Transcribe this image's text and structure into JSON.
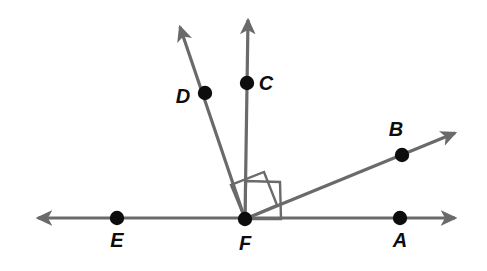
{
  "figure": {
    "kind": "geometry-diagram",
    "background_color": "#ffffff",
    "line_color": "#6a6a6a",
    "point_color": "#0d0d0d",
    "label_color": "#0d0d0d",
    "line_width": 3.2,
    "label_font_size": 20,
    "point_radius": 7.2
  },
  "chart_data": {
    "type": "diagram",
    "xlabel": "",
    "ylabel": "",
    "coordinate_space": {
      "width": 487,
      "height": 271,
      "y_axis": "down"
    },
    "vertex": {
      "name": "F",
      "x": 245,
      "y": 219
    },
    "points": [
      {
        "label": "A",
        "x": 400,
        "y": 218,
        "label_x": 400,
        "label_y": 247,
        "on": "ray-FA"
      },
      {
        "label": "B",
        "x": 402,
        "y": 155,
        "label_x": 396,
        "label_y": 136,
        "on": "ray-FB"
      },
      {
        "label": "C",
        "x": 247,
        "y": 83,
        "label_x": 266,
        "label_y": 90,
        "on": "ray-FC"
      },
      {
        "label": "D",
        "x": 205,
        "y": 93,
        "label_x": 183,
        "label_y": 103,
        "on": "ray-FD"
      },
      {
        "label": "E",
        "x": 117,
        "y": 218,
        "label_x": 117,
        "label_y": 247,
        "on": "line-EA"
      },
      {
        "label": "F",
        "x": 245,
        "y": 219,
        "label_x": 245,
        "label_y": 250,
        "on": "vertex"
      }
    ],
    "segments": [
      {
        "name": "line-EA",
        "x1": 38,
        "y1": 218,
        "x2": 455,
        "y2": 218,
        "arrow_start": true,
        "arrow_end": true
      },
      {
        "name": "ray-FC",
        "x1": 245,
        "y1": 219,
        "x2": 248,
        "y2": 20,
        "arrow_start": false,
        "arrow_end": true
      },
      {
        "name": "ray-FD",
        "x1": 245,
        "y1": 219,
        "x2": 180,
        "y2": 27,
        "arrow_start": false,
        "arrow_end": true
      },
      {
        "name": "ray-FB",
        "x1": 245,
        "y1": 219,
        "x2": 455,
        "y2": 133,
        "arrow_start": false,
        "arrow_end": true
      }
    ],
    "right_angle_marks": [
      {
        "name": "right-angle-DFC",
        "between": [
          "ray-FD",
          "ray-FC"
        ],
        "points": "245,219 231,185 264,172 277,205"
      },
      {
        "name": "right-angle-CFB",
        "between": [
          "ray-FC",
          "ray-FB"
        ],
        "points": "245,219 246,181 280,182 281,219"
      }
    ],
    "labels": [
      "A",
      "B",
      "C",
      "D",
      "E",
      "F"
    ]
  }
}
